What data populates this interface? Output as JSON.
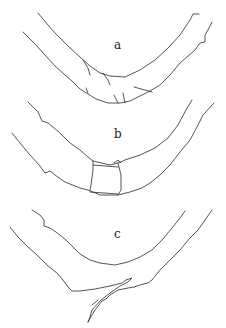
{
  "figure": {
    "panels": [
      {
        "label": "a",
        "description": "curved segment, intact"
      },
      {
        "label": "b",
        "description": "curved segment with rectangular joint section"
      },
      {
        "label": "c",
        "description": "curved segment with split/broken end"
      }
    ]
  }
}
